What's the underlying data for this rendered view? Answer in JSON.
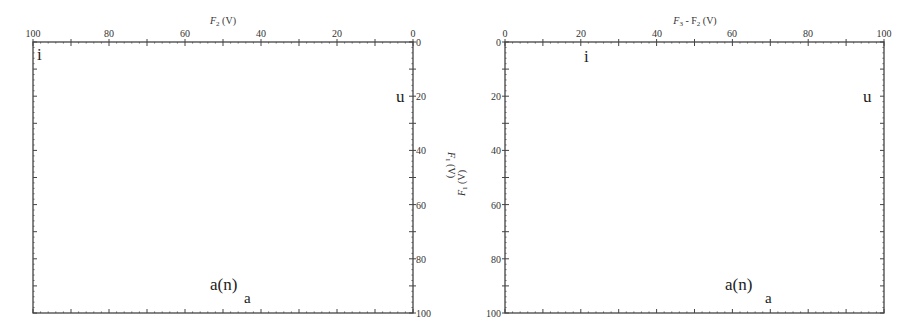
{
  "chart_data": [
    {
      "type": "scatter",
      "name": "left-vowel-chart",
      "title": "",
      "xlabel": "F2 (V)",
      "ylabel": "F1 (V)",
      "xlim": [
        100,
        0
      ],
      "ylim": [
        0,
        100
      ],
      "x_ticks": [
        100,
        80,
        60,
        40,
        20,
        0
      ],
      "y_ticks": [
        0,
        20,
        40,
        60,
        80,
        100
      ],
      "x_axis_position": "top",
      "y_axis_position": "right",
      "grid": false,
      "points": [
        {
          "label": "i",
          "x": 98,
          "y": 5
        },
        {
          "label": "u",
          "x": 3,
          "y": 20
        },
        {
          "label": "a(n)",
          "x": 50,
          "y": 90
        },
        {
          "label": "a",
          "x": 43,
          "y": 95
        }
      ]
    },
    {
      "type": "scatter",
      "name": "right-vowel-chart",
      "title": "",
      "xlabel": "F3 - F2 (V)",
      "ylabel": "F1 (V)",
      "xlim": [
        0,
        100
      ],
      "ylim": [
        0,
        100
      ],
      "x_ticks": [
        0,
        20,
        40,
        60,
        80,
        100
      ],
      "y_ticks": [
        0,
        20,
        40,
        60,
        80,
        100
      ],
      "x_axis_position": "top",
      "y_axis_position": "left",
      "grid": false,
      "points": [
        {
          "label": "i",
          "x": 22,
          "y": 5
        },
        {
          "label": "u",
          "x": 96,
          "y": 20
        },
        {
          "label": "a(n)",
          "x": 59,
          "y": 90
        },
        {
          "label": "a",
          "x": 70,
          "y": 95
        }
      ]
    }
  ],
  "left": {
    "xlabel_main": "F",
    "xlabel_sub": "2",
    "xlabel_unit": " (V)",
    "x_ticks": [
      "100",
      "80",
      "60",
      "40",
      "20",
      "0"
    ],
    "y_ticks": [
      "0",
      "20",
      "40",
      "60",
      "80",
      "100"
    ],
    "points": [
      "i",
      "u",
      "a(n)",
      "a"
    ]
  },
  "right": {
    "xlabel_main": "F",
    "xlabel_sub": "3",
    "xlabel_rest": " - F",
    "xlabel_sub2": "2",
    "xlabel_unit": " (V)",
    "x_ticks": [
      "0",
      "20",
      "40",
      "60",
      "80",
      "100"
    ],
    "y_ticks": [
      "0",
      "20",
      "40",
      "60",
      "80",
      "100"
    ],
    "points": [
      "i",
      "u",
      "a(n)",
      "a"
    ]
  },
  "shared_ylabel": {
    "main": "F",
    "sub": "1",
    "unit": " (V)"
  }
}
